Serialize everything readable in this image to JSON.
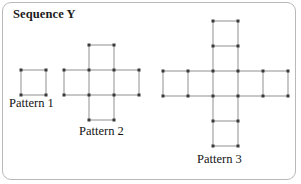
{
  "figure": {
    "title": "Sequence Y",
    "frame": {
      "border_color": "#b9b9b9",
      "background": "#ffffff",
      "corner_radius_px": 9
    },
    "style": {
      "edge_color": "#9a9a9a",
      "vertex_color": "#3a3a3a",
      "text_color": "#141414",
      "cell_size_px": 25,
      "vertex_size_px": 3
    }
  },
  "chart_data": {
    "type": "diagram",
    "title": "Sequence Y",
    "unit_cell_size_px": 25,
    "patterns": [
      {
        "label": "Pattern 1",
        "index": 1,
        "arm_length": 0,
        "square_count": 1,
        "vertex_count": 4,
        "origin": {
          "x": 21,
          "y": 70
        },
        "cells": [
          [
            0,
            0
          ]
        ],
        "label_position": {
          "x": 9,
          "y": 96
        }
      },
      {
        "label": "Pattern 2",
        "index": 2,
        "arm_length": 1,
        "square_count": 5,
        "vertex_count": 16,
        "origin": {
          "x": 64,
          "y": 45
        },
        "cells": [
          [
            1,
            0
          ],
          [
            0,
            1
          ],
          [
            1,
            1
          ],
          [
            2,
            1
          ],
          [
            1,
            2
          ]
        ],
        "label_position": {
          "x": 79,
          "y": 124
        }
      },
      {
        "label": "Pattern 3",
        "index": 3,
        "arm_length": 2,
        "square_count": 9,
        "vertex_count": 28,
        "origin": {
          "x": 163,
          "y": 21
        },
        "cells": [
          [
            2,
            0
          ],
          [
            2,
            1
          ],
          [
            0,
            2
          ],
          [
            1,
            2
          ],
          [
            2,
            2
          ],
          [
            3,
            2
          ],
          [
            4,
            2
          ],
          [
            2,
            3
          ],
          [
            2,
            4
          ]
        ],
        "label_position": {
          "x": 197,
          "y": 152
        }
      }
    ]
  }
}
